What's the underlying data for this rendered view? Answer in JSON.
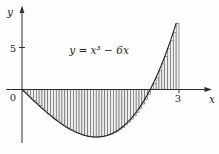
{
  "chart_data": {
    "type": "area",
    "title": "",
    "function_label": "y = x³ − 6x",
    "poly_coeffs_desc": [
      1,
      0,
      -6,
      0
    ],
    "x_range": [
      0,
      3
    ],
    "riemann": {
      "n": 55,
      "endpoint": "left"
    },
    "axis_labels": {
      "x": "x",
      "y": "y"
    },
    "origin_label": "0",
    "x_ticks": [
      {
        "value": 3,
        "label": "3"
      }
    ],
    "y_ticks": [
      {
        "value": 5,
        "label": "5"
      }
    ],
    "key_features": {
      "zeros": [
        0,
        2.449
      ],
      "minimum": {
        "x": 1.414,
        "y": -5.657
      },
      "right_end_value": {
        "x": 3,
        "y": 9
      }
    },
    "grid": false,
    "legend": false,
    "colors": {
      "line": "#1f1f1f",
      "rect_fill": "#efeeec",
      "rect_stroke": "#55555a",
      "background": "#fdfdfc"
    }
  }
}
